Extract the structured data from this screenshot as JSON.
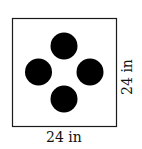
{
  "diagram": {
    "square": {
      "x": 12,
      "y": 18,
      "width": 104,
      "height": 108,
      "stroke": "#1a1a1a"
    },
    "dots": [
      {
        "cx": 64,
        "cy": 46,
        "r": 14
      },
      {
        "cx": 38,
        "cy": 72,
        "r": 14
      },
      {
        "cx": 90,
        "cy": 72,
        "r": 14
      },
      {
        "cx": 64,
        "cy": 99,
        "r": 14
      }
    ],
    "dot_color": "#000000",
    "bottom_label": "24 in",
    "right_label": "24 in"
  }
}
